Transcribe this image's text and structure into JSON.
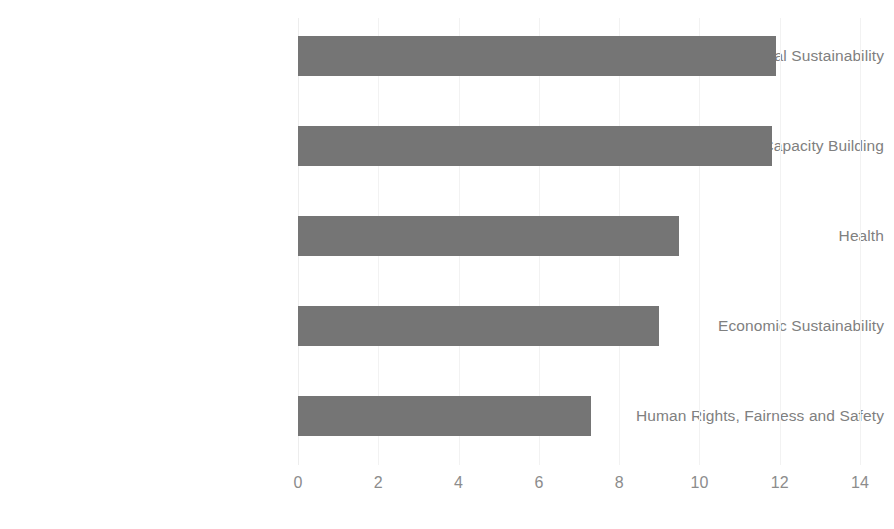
{
  "chart_data": {
    "type": "bar",
    "orientation": "horizontal",
    "title": "",
    "subtitle": "",
    "xlabel": "",
    "ylabel": "",
    "categories": [
      "Environmental Sustainability",
      "Education and Capacity Building",
      "Health",
      "Economic Sustainability",
      "Human Rights, Fairness and Safety"
    ],
    "values": [
      11.9,
      11.8,
      9.5,
      9.0,
      7.3
    ],
    "xlim": [
      0,
      14
    ],
    "ylim": null,
    "xticks": [
      0,
      2,
      4,
      6,
      8,
      10,
      12,
      14
    ],
    "xtick_labels": [
      "0",
      "2",
      "4",
      "6",
      "8",
      "10",
      "12",
      "14"
    ],
    "grid": true,
    "grid_axis": "x",
    "legend": false,
    "legend_position": "none",
    "series": [
      {
        "name": "",
        "values": [
          11.9,
          11.8,
          9.5,
          9.0,
          7.3
        ]
      }
    ],
    "colors": {
      "bar_fill": "#757575",
      "gridline": "#f2f2f2",
      "tick_label": "#8c8c8c",
      "category_label": "#808080",
      "background": "#ffffff"
    }
  }
}
